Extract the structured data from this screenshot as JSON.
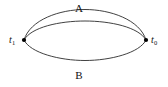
{
  "figure": {
    "name": "two-path-loop-diagram",
    "background_color": "#ffffff",
    "stroke_color": "#2b2b2b",
    "stroke_width": 0.9,
    "vertex_marker_color": "#000000"
  },
  "labels": {
    "path_top": "A",
    "path_bottom": "B",
    "vertex_left_symbol": "t",
    "vertex_left_subscript": "1",
    "vertex_right_symbol": "t",
    "vertex_right_subscript": "0"
  },
  "geometry": {
    "vertex_left": {
      "x": 24,
      "y": 40
    },
    "vertex_right": {
      "x": 146,
      "y": 40
    },
    "arc_top_outer_apex_y": 14,
    "arc_top_inner_apex_y": 21,
    "arc_bottom_apex_y": 60,
    "marker_radius": 2.1
  }
}
